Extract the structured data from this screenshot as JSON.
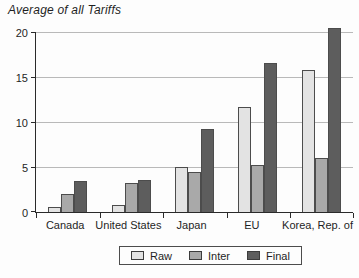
{
  "title": "Average of all Tariffs",
  "colors": {
    "background": "#fdfdfd",
    "axis": "#2a2a2a",
    "gridline": "#b9b9b9",
    "bar_border": "#4c4c4c",
    "raw": "#e3e3e3",
    "inter": "#a9a9a9",
    "final": "#5d5d5d",
    "text": "#1f1f1f"
  },
  "chart_data": {
    "type": "bar",
    "title": "Average of all Tariffs",
    "categories": [
      "Canada",
      "United States",
      "Japan",
      "EU",
      "Korea, Rep. of"
    ],
    "series": [
      {
        "name": "Raw",
        "color": "#e3e3e3",
        "values": [
          0.6,
          0.8,
          5.0,
          11.7,
          15.8
        ]
      },
      {
        "name": "Inter",
        "color": "#a9a9a9",
        "values": [
          2.0,
          3.2,
          4.4,
          5.2,
          6.0
        ]
      },
      {
        "name": "Final",
        "color": "#5d5d5d",
        "values": [
          3.5,
          3.6,
          9.2,
          16.6,
          20.4
        ]
      }
    ],
    "xlabel": "",
    "ylabel": "",
    "ylim": [
      0,
      20
    ],
    "yticks": [
      0,
      5,
      10,
      15,
      20
    ],
    "grid": "horizontal",
    "legend_position": "bottom-center"
  },
  "legend": {
    "items": [
      {
        "label": "Raw"
      },
      {
        "label": "Inter"
      },
      {
        "label": "Final"
      }
    ]
  }
}
